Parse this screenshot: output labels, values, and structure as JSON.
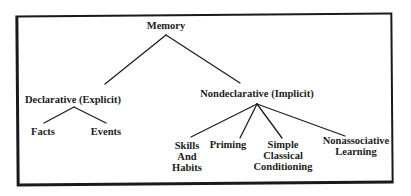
{
  "diagram": {
    "type": "tree",
    "root": {
      "label": "Memory",
      "children": [
        {
          "label": "Declarative (Explicit)",
          "children": [
            {
              "label": "Facts"
            },
            {
              "label": "Events"
            }
          ]
        },
        {
          "label": "Nondeclarative (Implicit)",
          "children": [
            {
              "label": "Skills\nAnd\nHabits"
            },
            {
              "label": "Priming"
            },
            {
              "label": "Simple\nClassical\nConditioning"
            },
            {
              "label": "Nonassociative\nLearning"
            }
          ]
        }
      ]
    },
    "colors": {
      "line": "#1f1f1f",
      "text": "#1c1c1c",
      "background": "#ffffff",
      "border": "#1a1a1a"
    }
  }
}
